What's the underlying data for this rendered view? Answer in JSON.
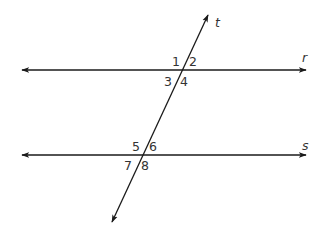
{
  "diagram": {
    "stroke_color": "#1a1a1a",
    "text_color": "#333333",
    "lines": [
      {
        "id": "r",
        "label": "r",
        "type": "line",
        "x1": 22,
        "y1": 70,
        "x2": 306,
        "y2": 70,
        "label_x": 302,
        "label_y": 62
      },
      {
        "id": "s",
        "label": "s",
        "type": "line",
        "x1": 22,
        "y1": 155,
        "x2": 306,
        "y2": 155,
        "label_x": 302,
        "label_y": 150
      },
      {
        "id": "t",
        "label": "t",
        "type": "transversal",
        "x1": 208,
        "y1": 15,
        "x2": 112,
        "y2": 222,
        "label_x": 215,
        "label_y": 27
      }
    ],
    "intersections": [
      {
        "lines": [
          "r",
          "t"
        ],
        "x": 182,
        "y": 70
      },
      {
        "lines": [
          "s",
          "t"
        ],
        "x": 143,
        "y": 155
      }
    ],
    "angles": [
      {
        "label": "1",
        "x": 176,
        "y": 66
      },
      {
        "label": "2",
        "x": 193,
        "y": 66
      },
      {
        "label": "3",
        "x": 168,
        "y": 86
      },
      {
        "label": "4",
        "x": 184,
        "y": 86
      },
      {
        "label": "5",
        "x": 136,
        "y": 151
      },
      {
        "label": "6",
        "x": 153,
        "y": 151
      },
      {
        "label": "7",
        "x": 128,
        "y": 170
      },
      {
        "label": "8",
        "x": 145,
        "y": 170
      }
    ]
  }
}
